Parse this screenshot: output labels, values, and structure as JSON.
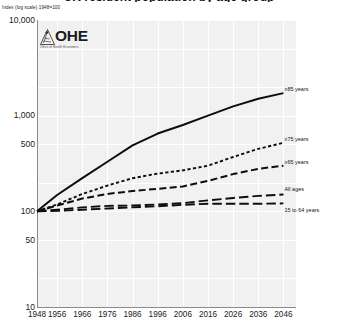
{
  "title": "UK resident population by age group",
  "axis_note": "Index (log scale) 1948=100",
  "logo": {
    "wordmark": "OHE",
    "tagline": "Office of Health Economics",
    "mark_icon": "ohe-emblem-icon"
  },
  "chart_data": {
    "type": "line",
    "title": "UK resident population by age group",
    "xlabel": "",
    "ylabel": "Index (log scale) 1948=100",
    "scale": "log",
    "grid": true,
    "legend_position": "right-inline",
    "xlim": [
      1948,
      2051
    ],
    "ylim": [
      10,
      10000
    ],
    "yticks": [
      "10,000",
      "1,000",
      "500",
      "100",
      "50",
      "10"
    ],
    "ytick_values": [
      10000,
      1000,
      500,
      100,
      50,
      10
    ],
    "xticks": [
      "1948",
      "1956",
      "1966",
      "1976",
      "1986",
      "1996",
      "2006",
      "2016",
      "2026",
      "2036",
      "2046"
    ],
    "xtick_values": [
      1948,
      1956,
      1966,
      1976,
      1986,
      1996,
      2006,
      2016,
      2026,
      2036,
      2046
    ],
    "x": [
      1948,
      1956,
      1966,
      1976,
      1986,
      1996,
      2006,
      2016,
      2026,
      2036,
      2046
    ],
    "series": [
      {
        "name": ">=85 years",
        "label": "≥85 years",
        "style": "solid",
        "values": [
          100,
          148,
          222,
          330,
          490,
          650,
          800,
          1000,
          1250,
          1500,
          1720
        ]
      },
      {
        "name": ">=75 years",
        "label": "≥75 years",
        "style": "dotted",
        "values": [
          100,
          118,
          152,
          186,
          222,
          248,
          268,
          300,
          370,
          450,
          520
        ]
      },
      {
        "name": ">=65 years",
        "label": "≥65 years",
        "style": "dashed",
        "values": [
          100,
          115,
          136,
          152,
          163,
          172,
          182,
          208,
          245,
          278,
          300
        ]
      },
      {
        "name": "All ages",
        "label": "All ages",
        "style": "long-dash",
        "values": [
          100,
          104,
          110,
          114,
          115,
          118,
          122,
          130,
          138,
          145,
          150
        ]
      },
      {
        "name": "15 to 64 years",
        "label": "15 to 64 years",
        "style": "long-dash",
        "values": [
          100,
          101,
          104,
          107,
          110,
          113,
          117,
          120,
          120,
          120,
          121
        ]
      }
    ]
  }
}
